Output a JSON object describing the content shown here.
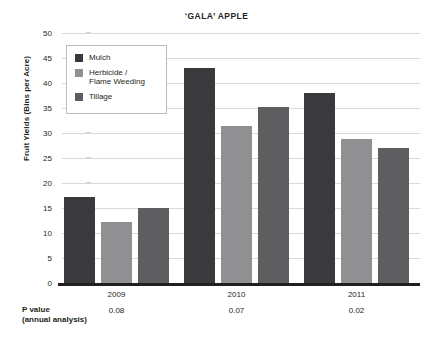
{
  "chart_data": {
    "type": "bar",
    "title": "‘GALA’ APPLE",
    "xlabel": "",
    "ylabel": "Fruit Yields (Bins per Acre)",
    "ylim": [
      0,
      50
    ],
    "ytick_step": 5,
    "yticks": [
      "50",
      "45",
      "40",
      "35",
      "30",
      "25",
      "20",
      "15",
      "10",
      "5",
      "0"
    ],
    "categories": [
      "2009",
      "2010",
      "2011"
    ],
    "grid": true,
    "legend_position": "upper-left-inside",
    "series": [
      {
        "name": "Mulch",
        "color": "#3a3a3c",
        "values": [
          17.2,
          43.0,
          38.1
        ]
      },
      {
        "name": "Herbicide /\nFlame Weeding",
        "color": "#909092",
        "values": [
          12.2,
          31.5,
          28.8
        ]
      },
      {
        "name": "Tillage",
        "color": "#5e5e60",
        "values": [
          15.1,
          35.3,
          27.0
        ]
      }
    ],
    "annotations": {
      "pvalue_caption": "P value\n(annual analysis)",
      "pvalues": [
        "0.08",
        "0.07",
        "0.02"
      ]
    }
  }
}
